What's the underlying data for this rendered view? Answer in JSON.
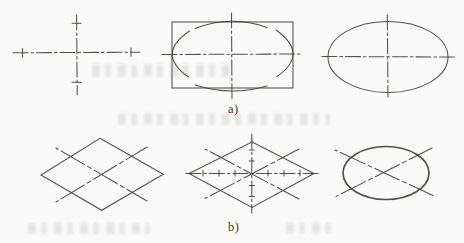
{
  "figure": {
    "background": "#fbfaf7",
    "ink": "#44413b",
    "row_labels": {
      "a": "a)",
      "b": "b)"
    }
  },
  "drawing": {
    "width": 464,
    "height": 243,
    "panels": [
      {
        "name": "panel-axes-cross",
        "shapes": [
          {
            "kind": "line",
            "name": "horizontal-centerline",
            "cls": "centerline",
            "attrs": {
              "x1": 13,
              "y1": 52.8,
              "x2": 140,
              "y2": 52.2
            }
          },
          {
            "kind": "line",
            "name": "vertical-centerline",
            "cls": "centerline",
            "attrs": {
              "x1": 76.6,
              "y1": 15,
              "x2": 77.2,
              "y2": 94.5
            }
          },
          {
            "kind": "line",
            "name": "axis-tick",
            "cls": "solid",
            "attrs": {
              "x1": 22.5,
              "y1": 48.5,
              "x2": 22.5,
              "y2": 57
            }
          },
          {
            "kind": "line",
            "name": "axis-tick",
            "cls": "solid",
            "attrs": {
              "x1": 131,
              "y1": 48,
              "x2": 131,
              "y2": 56
            }
          },
          {
            "kind": "line",
            "name": "axis-tick",
            "cls": "solid",
            "attrs": {
              "x1": 72,
              "y1": 23.3,
              "x2": 81,
              "y2": 23.3
            }
          },
          {
            "kind": "line",
            "name": "axis-tick",
            "cls": "solid",
            "attrs": {
              "x1": 72.3,
              "y1": 82.3,
              "x2": 81.3,
              "y2": 82.3
            }
          }
        ]
      },
      {
        "name": "panel-rectangle-construction",
        "shapes": [
          {
            "kind": "rect",
            "name": "construction-rectangle",
            "cls": "solid",
            "attrs": {
              "x": 172,
              "y": 22,
              "width": 121,
              "height": 66
            }
          },
          {
            "kind": "line",
            "name": "horizontal-centerline",
            "cls": "centerline",
            "attrs": {
              "x1": 162,
              "y1": 54.5,
              "x2": 302,
              "y2": 54
            }
          },
          {
            "kind": "line",
            "name": "vertical-centerline",
            "cls": "centerline",
            "attrs": {
              "x1": 231.5,
              "y1": 13,
              "x2": 232,
              "y2": 100
            }
          },
          {
            "kind": "path",
            "name": "top-arc",
            "cls": "solid",
            "attrs": {
              "d": "M 195 28.5 Q 231 14.5 267 27.5"
            }
          },
          {
            "kind": "path",
            "name": "bottom-arc",
            "cls": "solid",
            "attrs": {
              "d": "M 195 85 Q 231 96.5 267 86"
            }
          },
          {
            "kind": "path",
            "name": "left-arc",
            "cls": "solid",
            "attrs": {
              "d": "M 189.5 31 Q 155.5 54 188.5 77"
            }
          },
          {
            "kind": "path",
            "name": "right-arc",
            "cls": "solid",
            "attrs": {
              "d": "M 276 30 Q 309.5 54 277 76.5"
            }
          }
        ]
      },
      {
        "name": "panel-finished-ellipse",
        "shapes": [
          {
            "kind": "ellipse",
            "name": "ellipse-outline",
            "cls": "solid",
            "attrs": {
              "cx": 388,
              "cy": 57,
              "rx": 60,
              "ry": 35.5
            }
          },
          {
            "kind": "line",
            "name": "horizontal-centerline",
            "cls": "centerline",
            "attrs": {
              "x1": 322,
              "y1": 56.5,
              "x2": 456,
              "y2": 57
            }
          },
          {
            "kind": "line",
            "name": "vertical-centerline",
            "cls": "centerline",
            "attrs": {
              "x1": 387.3,
              "y1": 15,
              "x2": 388,
              "y2": 97
            }
          }
        ]
      },
      {
        "name": "panel-rhombus-diagonals",
        "shapes": [
          {
            "kind": "polygon",
            "name": "rhombus",
            "cls": "solid",
            "attrs": {
              "points": "100,138.3 163.3,174.3 101.7,210.3 41,175"
            }
          },
          {
            "kind": "line",
            "name": "diagonal-line",
            "cls": "longdash",
            "attrs": {
              "x1": 56,
              "y1": 148,
              "x2": 147,
              "y2": 201
            }
          },
          {
            "kind": "line",
            "name": "diagonal-line",
            "cls": "longdash",
            "attrs": {
              "x1": 56,
              "y1": 202,
              "x2": 147,
              "y2": 147
            }
          }
        ]
      },
      {
        "name": "panel-rhombus-centerlines",
        "shapes": [
          {
            "kind": "polygon",
            "name": "rhombus",
            "cls": "solid",
            "attrs": {
              "points": "252,142 314,173.5 252,207.5 189,173.5"
            }
          },
          {
            "kind": "line",
            "name": "horizontal-centerline",
            "cls": "centerline",
            "attrs": {
              "x1": 186,
              "y1": 173.5,
              "x2": 318,
              "y2": 173.5
            }
          },
          {
            "kind": "line",
            "name": "vertical-centerline",
            "cls": "centerline",
            "attrs": {
              "x1": 251.8,
              "y1": 134,
              "x2": 251.8,
              "y2": 213
            }
          },
          {
            "kind": "line",
            "name": "diagonal-line",
            "cls": "longdash",
            "attrs": {
              "x1": 205,
              "y1": 149,
              "x2": 299,
              "y2": 199
            }
          },
          {
            "kind": "line",
            "name": "diagonal-line",
            "cls": "longdash",
            "attrs": {
              "x1": 205,
              "y1": 198.5,
              "x2": 299,
              "y2": 149
            }
          },
          {
            "kind": "line",
            "name": "division-tick",
            "cls": "solid",
            "attrs": {
              "x1": 203,
              "y1": 170.5,
              "x2": 203,
              "y2": 176
            }
          },
          {
            "kind": "line",
            "name": "division-tick",
            "cls": "solid",
            "attrs": {
              "x1": 219,
              "y1": 170.5,
              "x2": 219,
              "y2": 176
            }
          },
          {
            "kind": "line",
            "name": "division-tick",
            "cls": "solid",
            "attrs": {
              "x1": 235,
              "y1": 170.5,
              "x2": 235,
              "y2": 176
            }
          },
          {
            "kind": "line",
            "name": "division-tick",
            "cls": "solid",
            "attrs": {
              "x1": 268,
              "y1": 170.5,
              "x2": 268,
              "y2": 176
            }
          },
          {
            "kind": "line",
            "name": "division-tick",
            "cls": "solid",
            "attrs": {
              "x1": 284,
              "y1": 170.5,
              "x2": 284,
              "y2": 176
            }
          },
          {
            "kind": "line",
            "name": "division-tick",
            "cls": "solid",
            "attrs": {
              "x1": 300,
              "y1": 170.5,
              "x2": 300,
              "y2": 176
            }
          },
          {
            "kind": "line",
            "name": "division-tick",
            "cls": "solid",
            "attrs": {
              "x1": 249.3,
              "y1": 150,
              "x2": 254.3,
              "y2": 150
            }
          },
          {
            "kind": "line",
            "name": "division-tick",
            "cls": "solid",
            "attrs": {
              "x1": 249.3,
              "y1": 161,
              "x2": 254.3,
              "y2": 161
            }
          },
          {
            "kind": "line",
            "name": "division-tick",
            "cls": "solid",
            "attrs": {
              "x1": 249.3,
              "y1": 185.5,
              "x2": 254.3,
              "y2": 185.5
            }
          },
          {
            "kind": "line",
            "name": "division-tick",
            "cls": "solid",
            "attrs": {
              "x1": 249.3,
              "y1": 196.5,
              "x2": 254.3,
              "y2": 196.5
            }
          }
        ]
      },
      {
        "name": "panel-isometric-ellipse",
        "shapes": [
          {
            "kind": "line",
            "name": "diagonal-line",
            "cls": "longdash",
            "attrs": {
              "x1": 335,
              "y1": 150,
              "x2": 433,
              "y2": 195.5
            }
          },
          {
            "kind": "line",
            "name": "diagonal-line",
            "cls": "longdash",
            "attrs": {
              "x1": 336,
              "y1": 196.5,
              "x2": 432,
              "y2": 148
            }
          },
          {
            "kind": "ellipse",
            "name": "ellipse-outline",
            "cls": "bold",
            "attrs": {
              "cx": 386,
              "cy": 173,
              "rx": 43,
              "ry": 26.5
            }
          }
        ]
      }
    ]
  }
}
